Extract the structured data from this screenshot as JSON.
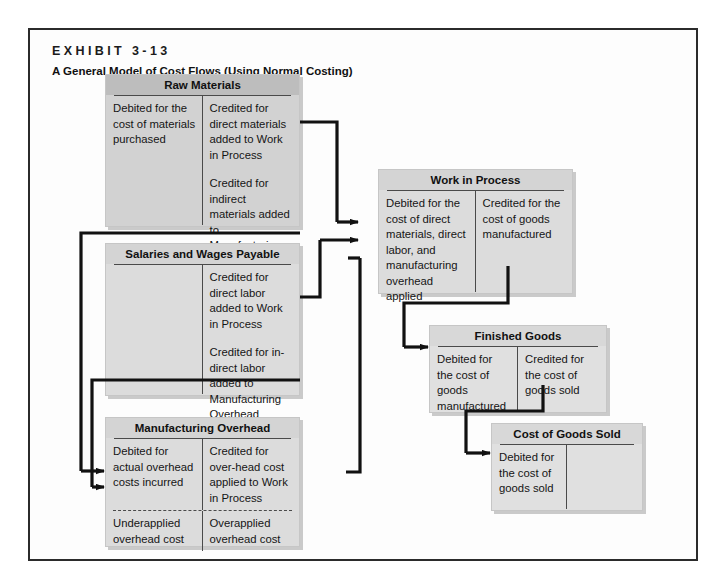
{
  "exhibit": {
    "label": "EXHIBIT 3-13",
    "title": "A General Model of Cost Flows (Using Normal Costing)"
  },
  "accounts": {
    "raw_materials": {
      "title": "Raw Materials",
      "debit": "Debited for the cost of materials purchased",
      "credit_1": "Credited for direct materials added to Work in Process",
      "credit_2": "Credited for indirect materials added to Manufacturing Overhead"
    },
    "salaries_wages": {
      "title": "Salaries and Wages Payable",
      "debit": "",
      "credit_1": "Credited for direct labor added to Work in Process",
      "credit_2": "Credited for in-direct labor added to Manufacturing Overhead"
    },
    "manufacturing_overhead": {
      "title": "Manufacturing Overhead",
      "debit": "Debited for actual overhead costs incurred",
      "credit": "Credited for over-head cost applied to Work in Process",
      "debit_lower": "Underapplied overhead cost",
      "credit_lower": "Overapplied overhead cost"
    },
    "work_in_process": {
      "title": "Work in Process",
      "debit": "Debited for the cost of direct materials, direct labor, and manufacturing overhead applied",
      "credit": "Credited for the cost of goods manufactured"
    },
    "finished_goods": {
      "title": "Finished Goods",
      "debit": "Debited for the cost of goods manufactured",
      "credit": "Credited for the cost of goods sold"
    },
    "cost_of_goods_sold": {
      "title": "Cost of Goods Sold",
      "debit": "Debited for the cost of goods sold",
      "credit": ""
    }
  },
  "flows": [
    {
      "name": "raw-materials-to-work-in-process",
      "from": "Raw Materials",
      "to": "Work in Process"
    },
    {
      "name": "raw-materials-to-manufacturing-overhead",
      "from": "Raw Materials",
      "to": "Manufacturing Overhead"
    },
    {
      "name": "salaries-wages-to-work-in-process",
      "from": "Salaries and Wages Payable",
      "to": "Work in Process"
    },
    {
      "name": "salaries-wages-to-manufacturing-overhead",
      "from": "Salaries and Wages Payable",
      "to": "Manufacturing Overhead"
    },
    {
      "name": "manufacturing-overhead-to-work-in-process",
      "from": "Manufacturing Overhead",
      "to": "Work in Process"
    },
    {
      "name": "work-in-process-to-finished-goods",
      "from": "Work in Process",
      "to": "Finished Goods"
    },
    {
      "name": "finished-goods-to-cost-of-goods-sold",
      "from": "Finished Goods",
      "to": "Cost of Goods Sold"
    }
  ],
  "colors": {
    "frame_border": "#2b2b2b",
    "box_fill": "#d2d2d2",
    "box_fill_light": "#dcdcdc",
    "header_fill": "#bdbdbd",
    "rule": "#4a4a4a",
    "connector": "#111111",
    "page_background": "#ffffff"
  }
}
